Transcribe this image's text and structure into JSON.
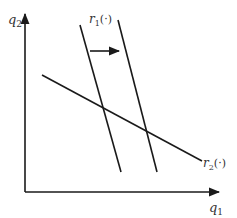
{
  "diagram": {
    "type": "reaction-function-shift",
    "axes": {
      "y_label": "q",
      "y_label_sub": "2",
      "x_label": "q",
      "x_label_sub": "1"
    },
    "curves": [
      {
        "name": "r1",
        "label": "r",
        "label_sub": "1",
        "label_args": "(·)",
        "description": "original reaction function r1 (left, steep)"
      },
      {
        "name": "r1-shifted",
        "description": "shifted reaction function r1 (right, steep)"
      },
      {
        "name": "r2",
        "label": "r",
        "label_sub": "2",
        "label_args": "(·)",
        "description": "reaction function r2 (shallow, downward sloping)"
      }
    ],
    "annotations": [
      {
        "type": "arrow",
        "direction": "right",
        "description": "shift of r1 to the right"
      }
    ],
    "colors": {
      "line": "#1a1a1a",
      "text": "#333333",
      "background": "#ffffff"
    }
  }
}
